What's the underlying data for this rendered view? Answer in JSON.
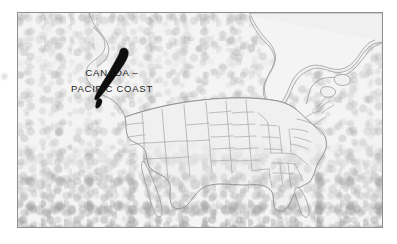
{
  "figure": {
    "kind": "scanned-map-figure",
    "region_title": "North America",
    "frame": {
      "border_color": "#8e8e8e",
      "background_color": "#f3f3f3"
    }
  },
  "label": {
    "name": "canada-pacific-coast-label",
    "line1": "CANADA –",
    "line2": "PACIFIC COAST",
    "text_color": "#1b1b1b"
  },
  "map": {
    "name": "north-america-outline-map",
    "coastline_color": "#9a9a9a",
    "border_color": "#8a8a8a",
    "state_border_color": "#a5a5a5",
    "land_fill": "#f0f0f0",
    "highlight": {
      "name": "british-columbia-pacific-coast-highlight",
      "fill_color": "#0d0d0d",
      "description": "Filled black coastal strip along the Pacific coast of British Columbia, Canada"
    },
    "features": [
      "Hudson Bay",
      "Great Lakes",
      "Gulf of Mexico",
      "Atlantic Coast",
      "Pacific Coast",
      "Florida Peninsula",
      "Baja California",
      "Canada-United States border",
      "Contiguous United States state boundaries"
    ]
  },
  "artifacts": {
    "edge_mark": "scan-edge-artifact",
    "texture": "photocopy-grain"
  }
}
